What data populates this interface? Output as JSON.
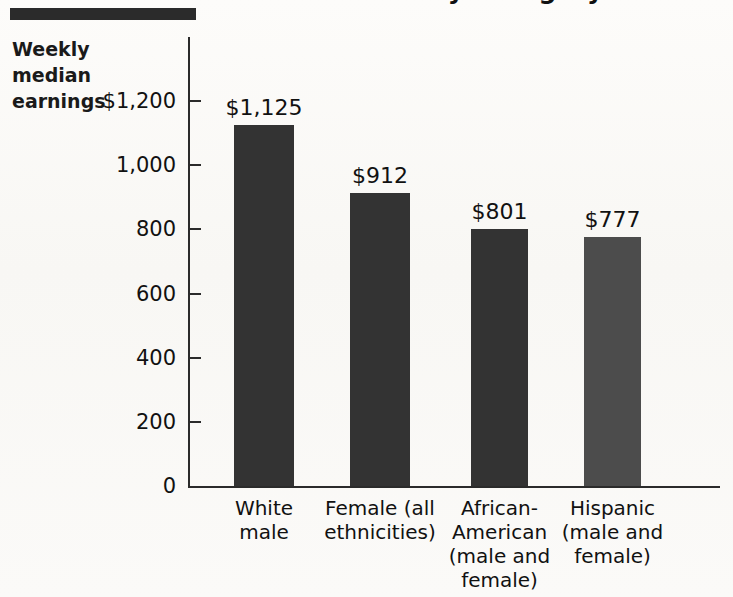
{
  "figure": {
    "rule_present": true,
    "title_partial": "by Category",
    "axis_label_lines": [
      "Weekly",
      "median",
      "earnings"
    ],
    "background_color": "#fbfaf8",
    "bar_color": "#333333",
    "bar_color_light": "#4c4c4c",
    "axis_color": "#2b2b2b"
  },
  "chart_data": {
    "type": "bar",
    "title": "by Category",
    "xlabel": "",
    "ylabel": "Weekly median earnings",
    "ylim": [
      0,
      1200
    ],
    "ytick_values": [
      0,
      200,
      400,
      600,
      800,
      1000,
      1200
    ],
    "ytick_labels": [
      "0",
      "200",
      "400",
      "600",
      "800",
      "1,000",
      "$1,200"
    ],
    "grid": false,
    "legend": "none",
    "categories": [
      "White male",
      "Female (all ethnicities)",
      "African-American (male and female)",
      "Hispanic (male and female)"
    ],
    "category_label_lines": [
      [
        "White",
        "male"
      ],
      [
        "Female (all",
        "ethnicities)"
      ],
      [
        "African-",
        "American",
        "(male and",
        "female)"
      ],
      [
        "Hispanic",
        "(male and",
        "female)"
      ]
    ],
    "values": [
      1125,
      912,
      801,
      777
    ],
    "value_labels": [
      "$1,125",
      "$912",
      "$801",
      "$777"
    ]
  }
}
